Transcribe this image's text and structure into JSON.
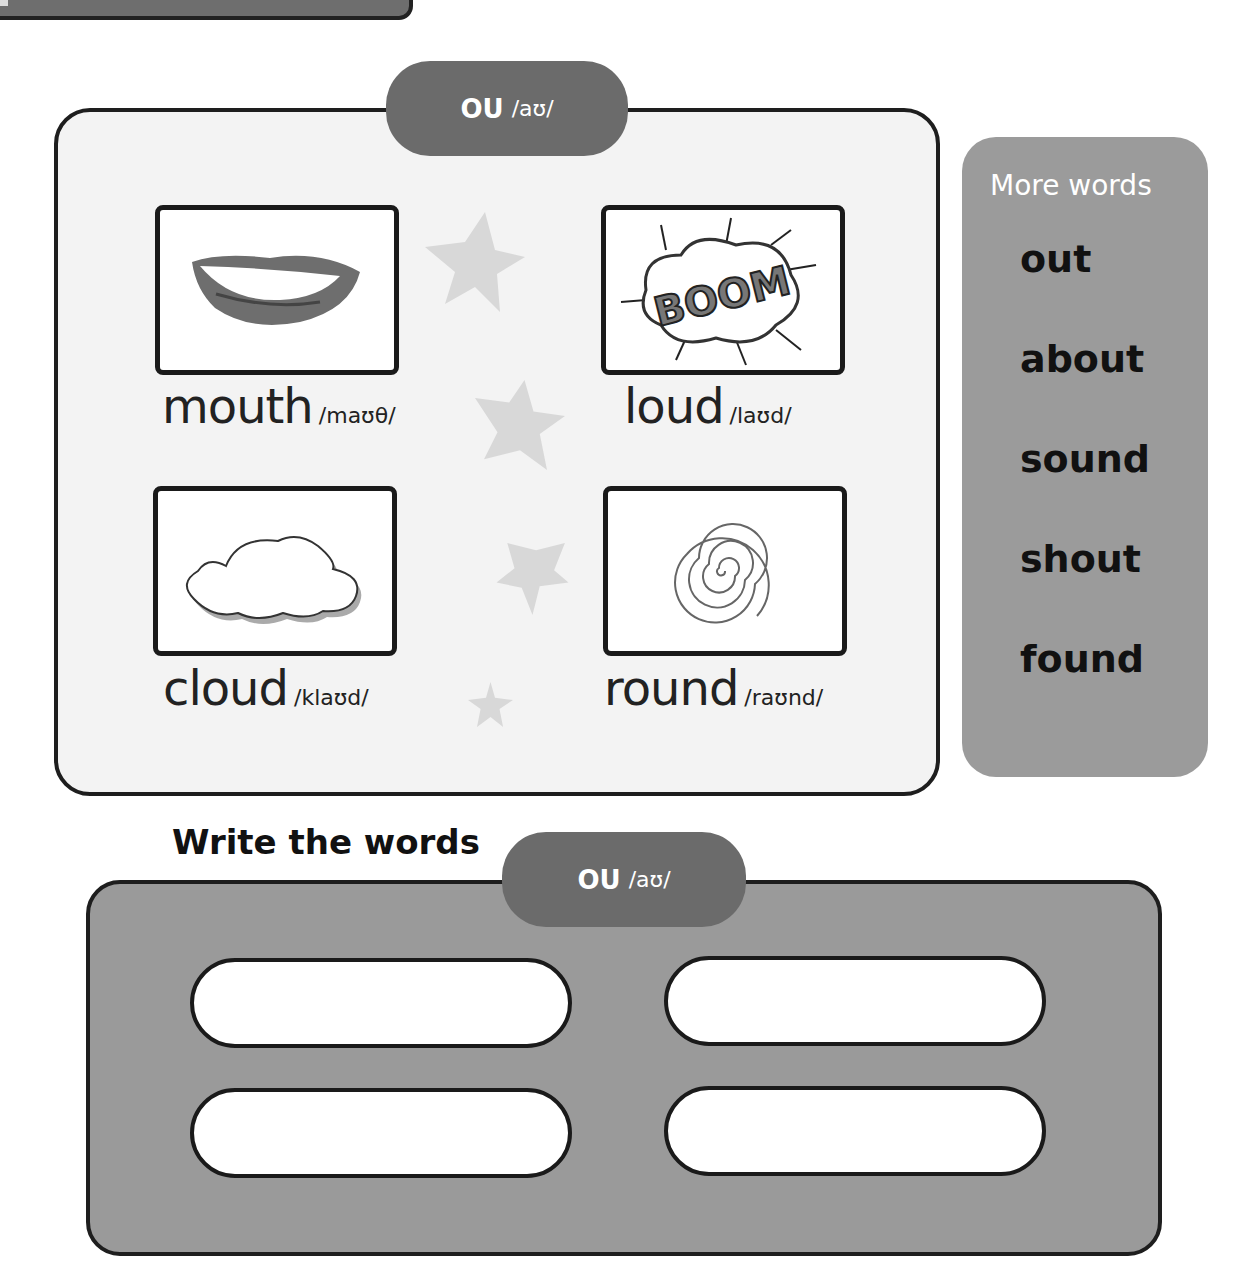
{
  "header_pill": {
    "letters": "OU",
    "ipa": "/aʊ/"
  },
  "cards": [
    {
      "word": "mouth",
      "ipa": "/maʊθ/",
      "image": "mouth-icon"
    },
    {
      "word": "loud",
      "ipa": "/laʊd/",
      "image": "boom-icon",
      "image_text": "BOOM"
    },
    {
      "word": "cloud",
      "ipa": "/klaʊd/",
      "image": "cloud-icon"
    },
    {
      "word": "round",
      "ipa": "/raʊnd/",
      "image": "spiral-icon"
    }
  ],
  "more_words": {
    "title": "More words",
    "items": [
      "out",
      "about",
      "sound",
      "shout",
      "found"
    ]
  },
  "write_section": {
    "title": "Write the words",
    "pill": {
      "letters": "OU",
      "ipa": "/aʊ/"
    },
    "inputs": [
      "",
      "",
      "",
      ""
    ]
  },
  "colors": {
    "pill": "#6b6b6b",
    "more_panel": "#9b9b9b",
    "write_panel": "#9a9a9a",
    "main_panel": "#f3f3f3",
    "star": "#d6d6d6"
  }
}
